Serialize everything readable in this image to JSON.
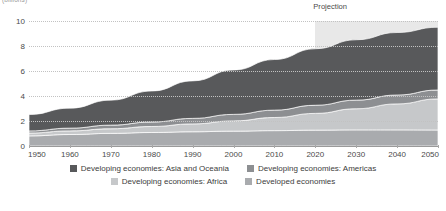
{
  "caption": {
    "units_label": "(billions)"
  },
  "annotations": {
    "projection_label": "Projection"
  },
  "legend": {
    "rows": [
      [
        {
          "label": "Developing economies: Asia and Oceania",
          "color": "#58595b"
        },
        {
          "label": "Developing economies: Americas",
          "color": "#8d8f92"
        }
      ],
      [
        {
          "label": "Developing economies: Africa",
          "color": "#c6c8ca"
        },
        {
          "label": "Developed economies",
          "color": "#a9abae"
        }
      ]
    ]
  },
  "chart_data": {
    "type": "area",
    "stacked": true,
    "title": "",
    "subtitle": "",
    "xlabel": "",
    "ylabel": "(billions)",
    "xlim": [
      1950,
      2050
    ],
    "ylim": [
      0,
      10
    ],
    "grid": true,
    "legend_position": "bottom",
    "x": [
      1950,
      1960,
      1970,
      1980,
      1990,
      2000,
      2010,
      2020,
      2030,
      2040,
      2050
    ],
    "xticks": [
      1950,
      1960,
      1970,
      1980,
      1990,
      2000,
      2010,
      2020,
      2030,
      2040,
      2050
    ],
    "yticks": [
      0,
      2,
      4,
      6,
      8,
      10
    ],
    "projection_start": 2020,
    "projection_end": 2050,
    "stack_order_bottom_to_top": [
      "Developed economies",
      "Developing economies: Africa",
      "Developing economies: Americas",
      "Developing economies: Asia and Oceania"
    ],
    "series": [
      {
        "name": "Developed economies",
        "color": "#a9abae",
        "values": [
          0.81,
          0.92,
          1.01,
          1.08,
          1.14,
          1.19,
          1.23,
          1.27,
          1.29,
          1.29,
          1.28
        ]
      },
      {
        "name": "Developing economies: Africa",
        "color": "#c6c8ca",
        "values": [
          0.23,
          0.29,
          0.37,
          0.48,
          0.63,
          0.82,
          1.05,
          1.34,
          1.69,
          2.08,
          2.49
        ]
      },
      {
        "name": "Developing economies: Americas",
        "color": "#8d8f92",
        "values": [
          0.17,
          0.22,
          0.29,
          0.36,
          0.44,
          0.52,
          0.59,
          0.65,
          0.69,
          0.71,
          0.71
        ]
      },
      {
        "name": "Developing economies: Asia and Oceania",
        "color": "#58595b",
        "values": [
          1.31,
          1.6,
          2.0,
          2.48,
          3.0,
          3.55,
          4.05,
          4.52,
          4.83,
          5.0,
          5.02
        ]
      }
    ],
    "totals": [
      2.52,
      3.03,
      3.67,
      4.4,
      5.21,
      6.08,
      6.92,
      7.78,
      8.5,
      9.08,
      9.5
    ]
  }
}
